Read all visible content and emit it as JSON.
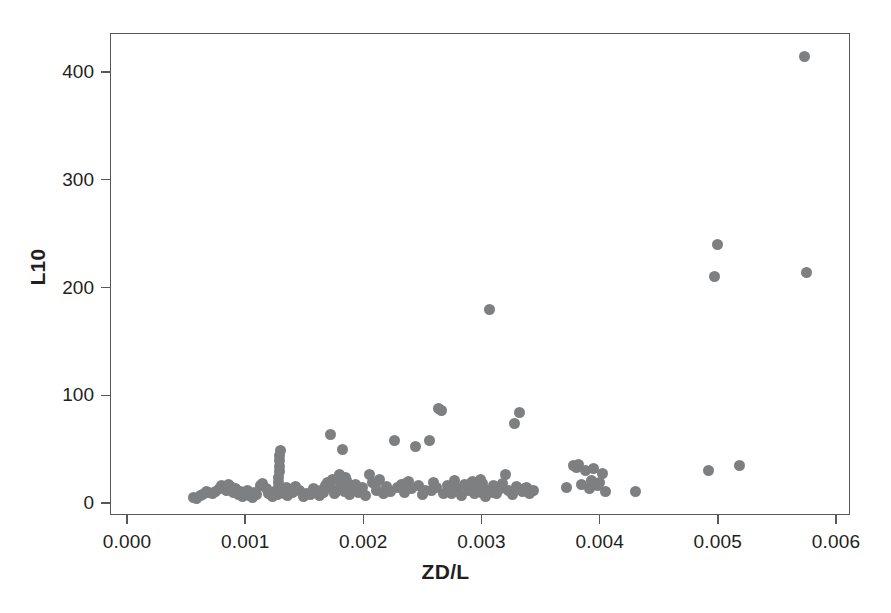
{
  "chart_data": {
    "type": "scatter",
    "title": "",
    "xlabel": "ZD/L",
    "ylabel": "L10",
    "xlim": [
      0.0,
      0.006
    ],
    "ylim": [
      -20,
      430
    ],
    "xticks": [
      0.0,
      0.001,
      0.002,
      0.003,
      0.004,
      0.005,
      0.006
    ],
    "xticklabels": [
      "0.000",
      "0.001",
      "0.002",
      "0.003",
      "0.004",
      "0.005",
      "0.006"
    ],
    "yticks": [
      0,
      100,
      200,
      300,
      400
    ],
    "yticklabels": [
      "0",
      "100",
      "200",
      "300",
      "400"
    ],
    "grid": false,
    "legend": null,
    "marker": {
      "shape": "circle",
      "color": "#7e7f81",
      "size_px": 11
    },
    "frame": {
      "box": true,
      "color": "#58595b"
    },
    "n_points": 153,
    "series": [
      {
        "name": "L10 vs ZD/L",
        "points": [
          [
            0.00056,
            5
          ],
          [
            0.00059,
            4
          ],
          [
            0.00062,
            7
          ],
          [
            0.00064,
            8
          ],
          [
            0.00067,
            11
          ],
          [
            0.00069,
            10
          ],
          [
            0.00078,
            13
          ],
          [
            0.0008,
            16
          ],
          [
            0.00082,
            14
          ],
          [
            0.00084,
            12
          ],
          [
            0.00086,
            17
          ],
          [
            0.00088,
            15
          ],
          [
            0.0009,
            10
          ],
          [
            0.00092,
            13
          ],
          [
            0.00094,
            8
          ],
          [
            0.00096,
            11
          ],
          [
            0.00098,
            6
          ],
          [
            0.001,
            9
          ],
          [
            0.00102,
            12
          ],
          [
            0.00104,
            7
          ],
          [
            0.00106,
            5
          ],
          [
            0.0011,
            8
          ],
          [
            0.00113,
            16
          ],
          [
            0.00115,
            18
          ],
          [
            0.00118,
            13
          ],
          [
            0.0012,
            9
          ],
          [
            0.00123,
            6
          ],
          [
            0.00125,
            11
          ],
          [
            0.00127,
            8
          ],
          [
            0.00128,
            14
          ],
          [
            0.00128,
            19
          ],
          [
            0.00128,
            24
          ],
          [
            0.00129,
            29
          ],
          [
            0.00129,
            34
          ],
          [
            0.00129,
            39
          ],
          [
            0.00129,
            44
          ],
          [
            0.0013,
            49
          ],
          [
            0.00131,
            13
          ],
          [
            0.00133,
            9
          ],
          [
            0.00136,
            7
          ],
          [
            0.0014,
            10
          ],
          [
            0.00143,
            15
          ],
          [
            0.00146,
            12
          ],
          [
            0.00149,
            6
          ],
          [
            0.00152,
            9
          ],
          [
            0.00155,
            8
          ],
          [
            0.00158,
            13
          ],
          [
            0.00161,
            11
          ],
          [
            0.00163,
            7
          ],
          [
            0.00166,
            10
          ],
          [
            0.00168,
            16
          ],
          [
            0.0017,
            19
          ],
          [
            0.00172,
            14
          ],
          [
            0.00172,
            64
          ],
          [
            0.00174,
            22
          ],
          [
            0.00176,
            9
          ],
          [
            0.00178,
            12
          ],
          [
            0.0018,
            26
          ],
          [
            0.00181,
            18
          ],
          [
            0.00182,
            50
          ],
          [
            0.00183,
            15
          ],
          [
            0.00184,
            11
          ],
          [
            0.00186,
            21
          ],
          [
            0.00188,
            8
          ],
          [
            0.0019,
            13
          ],
          [
            0.00193,
            17
          ],
          [
            0.00196,
            10
          ],
          [
            0.00199,
            14
          ],
          [
            0.00202,
            7
          ],
          [
            0.00205,
            26
          ],
          [
            0.00208,
            19
          ],
          [
            0.00211,
            12
          ],
          [
            0.00214,
            22
          ],
          [
            0.00217,
            9
          ],
          [
            0.0022,
            15
          ],
          [
            0.00223,
            11
          ],
          [
            0.00226,
            58
          ],
          [
            0.00229,
            14
          ],
          [
            0.00232,
            17
          ],
          [
            0.00235,
            10
          ],
          [
            0.00238,
            20
          ],
          [
            0.00241,
            13
          ],
          [
            0.00244,
            52
          ],
          [
            0.00247,
            16
          ],
          [
            0.0025,
            8
          ],
          [
            0.00253,
            12
          ],
          [
            0.00256,
            58
          ],
          [
            0.00259,
            19
          ],
          [
            0.00262,
            14
          ],
          [
            0.00264,
            88
          ],
          [
            0.00266,
            86
          ],
          [
            0.00268,
            9
          ],
          [
            0.00271,
            16
          ],
          [
            0.00274,
            11
          ],
          [
            0.00277,
            21
          ],
          [
            0.0028,
            13
          ],
          [
            0.00283,
            7
          ],
          [
            0.00286,
            17
          ],
          [
            0.00289,
            12
          ],
          [
            0.00292,
            20
          ],
          [
            0.00294,
            9
          ],
          [
            0.00296,
            15
          ],
          [
            0.00298,
            14
          ],
          [
            0.00299,
            22
          ],
          [
            0.003,
            10
          ],
          [
            0.00301,
            18
          ],
          [
            0.00302,
            13
          ],
          [
            0.00303,
            6
          ],
          [
            0.00305,
            11
          ],
          [
            0.00307,
            180
          ],
          [
            0.0031,
            16
          ],
          [
            0.00313,
            9
          ],
          [
            0.00316,
            13
          ],
          [
            0.0032,
            26
          ],
          [
            0.00323,
            12
          ],
          [
            0.00326,
            8
          ],
          [
            0.00328,
            74
          ],
          [
            0.0033,
            15
          ],
          [
            0.00332,
            84
          ],
          [
            0.00335,
            11
          ],
          [
            0.00338,
            14
          ],
          [
            0.00341,
            9
          ],
          [
            0.00344,
            12
          ],
          [
            0.00372,
            14
          ],
          [
            0.00378,
            35
          ],
          [
            0.0038,
            33
          ],
          [
            0.00382,
            36
          ],
          [
            0.00385,
            17
          ],
          [
            0.00388,
            30
          ],
          [
            0.00391,
            13
          ],
          [
            0.00395,
            32
          ],
          [
            0.00398,
            16
          ],
          [
            0.00402,
            27
          ],
          [
            0.00405,
            11
          ],
          [
            0.0043,
            11
          ],
          [
            0.00492,
            30
          ],
          [
            0.00497,
            210
          ],
          [
            0.005,
            240
          ],
          [
            0.00518,
            35
          ],
          [
            0.00573,
            414
          ],
          [
            0.00575,
            214
          ],
          [
            0.00072,
            9
          ],
          [
            0.00075,
            11
          ],
          [
            0.00108,
            10
          ],
          [
            0.00135,
            14
          ],
          [
            0.00138,
            11
          ],
          [
            0.00164,
            12
          ],
          [
            0.00185,
            24
          ],
          [
            0.00191,
            16
          ],
          [
            0.0021,
            17
          ],
          [
            0.00236,
            18
          ],
          [
            0.00258,
            12
          ],
          [
            0.00275,
            9
          ],
          [
            0.00291,
            18
          ],
          [
            0.00309,
            10
          ],
          [
            0.00318,
            18
          ],
          [
            0.00336,
            13
          ],
          [
            0.00393,
            21
          ],
          [
            0.004,
            19
          ]
        ]
      }
    ]
  }
}
